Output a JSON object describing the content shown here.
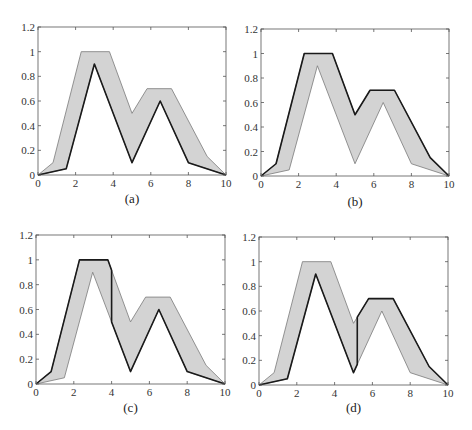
{
  "figure": {
    "panels": [
      {
        "id": "a",
        "caption": "(a)",
        "dark_rule": "lower"
      },
      {
        "id": "b",
        "caption": "(b)",
        "dark_rule": "upper"
      },
      {
        "id": "c",
        "caption": "(c)",
        "dark_rule": "upper_then_lower",
        "switch_x": 4.0
      },
      {
        "id": "d",
        "caption": "(d)",
        "dark_rule": "lower_then_upper",
        "switch_x": 5.2
      }
    ],
    "colors": {
      "fill": "#d3d3d3",
      "dark_line": "#1a1a1a",
      "light_line": "#7a7a7a",
      "axis": "#555555"
    }
  },
  "chart_data": [
    {
      "type": "area",
      "title": "(a)",
      "xlabel": "",
      "ylabel": "",
      "xlim": [
        0,
        10
      ],
      "ylim": [
        0,
        1.2
      ],
      "xticks": [
        "0",
        "2",
        "4",
        "6",
        "8",
        "10"
      ],
      "yticks": [
        "0",
        "0.2",
        "0.4",
        "0.6",
        "0.8",
        "1",
        "1.2"
      ],
      "grid": false,
      "series": [
        {
          "name": "upper",
          "x": [
            0,
            0.8,
            2.3,
            3.8,
            5.0,
            5.8,
            7.1,
            9.0,
            10
          ],
          "y": [
            0,
            0.1,
            1.0,
            1.0,
            0.5,
            0.7,
            0.7,
            0.15,
            0
          ]
        },
        {
          "name": "lower",
          "x": [
            0,
            1.5,
            3.0,
            5.0,
            6.5,
            8.0,
            10
          ],
          "y": [
            0,
            0.05,
            0.9,
            0.1,
            0.6,
            0.1,
            0
          ]
        }
      ],
      "highlighted": "lower curve (dark)"
    },
    {
      "type": "area",
      "title": "(b)",
      "xlim": [
        0,
        10
      ],
      "ylim": [
        0,
        1.2
      ],
      "xticks": [
        "0",
        "2",
        "4",
        "6",
        "8",
        "10"
      ],
      "yticks": [
        "0",
        "0.2",
        "0.4",
        "0.6",
        "0.8",
        "1",
        "1.2"
      ],
      "grid": false,
      "series": [
        {
          "name": "upper",
          "x": [
            0,
            0.8,
            2.3,
            3.8,
            5.0,
            5.8,
            7.1,
            9.0,
            10
          ],
          "y": [
            0,
            0.1,
            1.0,
            1.0,
            0.5,
            0.7,
            0.7,
            0.15,
            0
          ]
        },
        {
          "name": "lower",
          "x": [
            0,
            1.5,
            3.0,
            5.0,
            6.5,
            8.0,
            10
          ],
          "y": [
            0,
            0.05,
            0.9,
            0.1,
            0.6,
            0.1,
            0
          ]
        }
      ],
      "highlighted": "upper curve (dark)"
    },
    {
      "type": "area",
      "title": "(c)",
      "xlim": [
        0,
        10
      ],
      "ylim": [
        0,
        1.2
      ],
      "xticks": [
        "0",
        "2",
        "4",
        "6",
        "8",
        "10"
      ],
      "yticks": [
        "0",
        "0.2",
        "0.4",
        "0.6",
        "0.8",
        "1",
        "1.2"
      ],
      "grid": false,
      "series": [
        {
          "name": "upper",
          "x": [
            0,
            0.8,
            2.3,
            3.8,
            5.0,
            5.8,
            7.1,
            9.0,
            10
          ],
          "y": [
            0,
            0.1,
            1.0,
            1.0,
            0.5,
            0.7,
            0.7,
            0.15,
            0
          ]
        },
        {
          "name": "lower",
          "x": [
            0,
            1.5,
            3.0,
            5.0,
            6.5,
            8.0,
            10
          ],
          "y": [
            0,
            0.05,
            0.9,
            0.1,
            0.6,
            0.1,
            0
          ]
        }
      ],
      "highlighted": "upper curve for x<4, vertical drop at x=4, lower curve for x>4"
    },
    {
      "type": "area",
      "title": "(d)",
      "xlim": [
        0,
        10
      ],
      "ylim": [
        0,
        1.2
      ],
      "xticks": [
        "0",
        "2",
        "4",
        "6",
        "8",
        "10"
      ],
      "yticks": [
        "0",
        "0.2",
        "0.4",
        "0.6",
        "0.8",
        "1",
        "1.2"
      ],
      "grid": false,
      "series": [
        {
          "name": "upper",
          "x": [
            0,
            0.8,
            2.3,
            3.8,
            5.0,
            5.8,
            7.1,
            9.0,
            10
          ],
          "y": [
            0,
            0.1,
            1.0,
            1.0,
            0.5,
            0.7,
            0.7,
            0.15,
            0
          ]
        },
        {
          "name": "lower",
          "x": [
            0,
            1.5,
            3.0,
            5.0,
            6.5,
            8.0,
            10
          ],
          "y": [
            0,
            0.05,
            0.9,
            0.1,
            0.6,
            0.1,
            0
          ]
        }
      ],
      "highlighted": "lower curve for x<5.2, vertical jump at x=5.2, upper curve for x>5.2"
    }
  ]
}
